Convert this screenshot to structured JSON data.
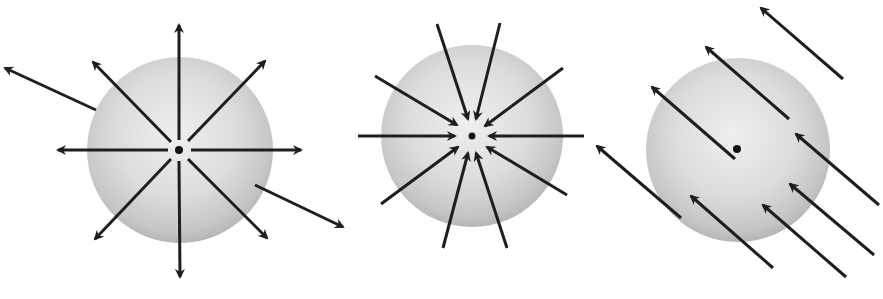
{
  "diagram": {
    "colors": {
      "background": "#ffffff",
      "sphere_highlight": "#efefef",
      "sphere_mid": "#d6d6d6",
      "sphere_edge": "#b2b2b2",
      "arrow": "#1e1e1e",
      "center_dot": "#111111"
    },
    "panels": [
      {
        "id": "outward",
        "label": "field lines radiating outward from central charge",
        "sphere": {
          "cx": 180,
          "cy": 150,
          "r": 93
        },
        "dot": {
          "cx": 179,
          "cy": 150,
          "r": 4
        },
        "arrows": [
          {
            "x1": 179,
            "y1": 140,
            "x2": 179,
            "y2": 25
          },
          {
            "x1": 179,
            "y1": 161,
            "x2": 180,
            "y2": 277
          },
          {
            "x1": 168,
            "y1": 150,
            "x2": 58,
            "y2": 150
          },
          {
            "x1": 191,
            "y1": 150,
            "x2": 301,
            "y2": 150
          },
          {
            "x1": 171,
            "y1": 142,
            "x2": 93,
            "y2": 62
          },
          {
            "x1": 188,
            "y1": 141,
            "x2": 265,
            "y2": 61
          },
          {
            "x1": 171,
            "y1": 159,
            "x2": 95,
            "y2": 239
          },
          {
            "x1": 188,
            "y1": 159,
            "x2": 267,
            "y2": 238
          },
          {
            "x1": 96,
            "y1": 110,
            "x2": 5,
            "y2": 68
          },
          {
            "x1": 255,
            "y1": 185,
            "x2": 343,
            "y2": 227
          }
        ]
      },
      {
        "id": "inward",
        "label": "field lines converging inward to central charge",
        "sphere": {
          "cx": 472,
          "cy": 136,
          "r": 91
        },
        "dot": {
          "cx": 472,
          "cy": 136,
          "r": 3.5
        },
        "arrows": [
          {
            "x1": 437,
            "y1": 24,
            "x2": 468,
            "y2": 119
          },
          {
            "x1": 500,
            "y1": 23,
            "x2": 476,
            "y2": 119
          },
          {
            "x1": 375,
            "y1": 76,
            "x2": 457,
            "y2": 125
          },
          {
            "x1": 563,
            "y1": 68,
            "x2": 485,
            "y2": 126
          },
          {
            "x1": 358,
            "y1": 136,
            "x2": 455,
            "y2": 136
          },
          {
            "x1": 584,
            "y1": 136,
            "x2": 489,
            "y2": 136
          },
          {
            "x1": 381,
            "y1": 204,
            "x2": 458,
            "y2": 147
          },
          {
            "x1": 567,
            "y1": 195,
            "x2": 487,
            "y2": 147
          },
          {
            "x1": 443,
            "y1": 248,
            "x2": 468,
            "y2": 153
          },
          {
            "x1": 507,
            "y1": 248,
            "x2": 476,
            "y2": 153
          }
        ]
      },
      {
        "id": "uniform",
        "label": "uniform parallel field lines passing through sphere",
        "sphere": {
          "cx": 738,
          "cy": 150,
          "r": 92
        },
        "dot": {
          "cx": 737,
          "cy": 149,
          "r": 4
        },
        "arrows": [
          {
            "x1": 843,
            "y1": 79,
            "x2": 761,
            "y2": 8
          },
          {
            "x1": 789,
            "y1": 119,
            "x2": 706,
            "y2": 47
          },
          {
            "x1": 735,
            "y1": 159,
            "x2": 652,
            "y2": 87
          },
          {
            "x1": 681,
            "y1": 218,
            "x2": 597,
            "y2": 146
          },
          {
            "x1": 879,
            "y1": 205,
            "x2": 796,
            "y2": 134
          },
          {
            "x1": 874,
            "y1": 255,
            "x2": 790,
            "y2": 184
          },
          {
            "x1": 846,
            "y1": 277,
            "x2": 763,
            "y2": 205
          },
          {
            "x1": 773,
            "y1": 268,
            "x2": 691,
            "y2": 196
          }
        ]
      }
    ]
  }
}
